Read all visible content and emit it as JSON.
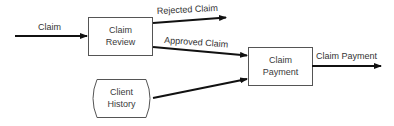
{
  "diagram": {
    "type": "data-flow",
    "nodes": [
      {
        "id": "claim-review",
        "lines": [
          "Claim",
          "Review"
        ],
        "shape": "process-box"
      },
      {
        "id": "claim-payment",
        "lines": [
          "Claim",
          "Payment"
        ],
        "shape": "process-box"
      },
      {
        "id": "client-history",
        "lines": [
          "Client",
          "History"
        ],
        "shape": "data-store"
      }
    ],
    "flows": [
      {
        "id": "claim",
        "label": "Claim",
        "from": "external",
        "to": "claim-review"
      },
      {
        "id": "rejected-claim",
        "label": "Rejected Claim",
        "from": "claim-review",
        "to": "external"
      },
      {
        "id": "approved-claim",
        "label": "Approved Claim",
        "from": "claim-review",
        "to": "claim-payment"
      },
      {
        "id": "client-history-flow",
        "label": "",
        "from": "client-history",
        "to": "claim-payment"
      },
      {
        "id": "claim-payment-out",
        "label": "Claim Payment",
        "from": "claim-payment",
        "to": "external"
      }
    ],
    "colors": {
      "line": "#111111",
      "box_stroke": "#555555",
      "text": "#333333"
    }
  }
}
